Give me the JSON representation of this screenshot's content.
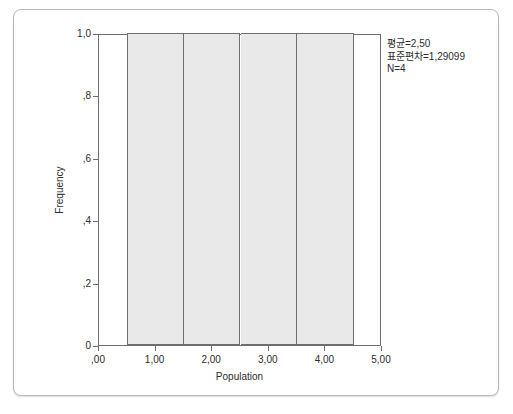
{
  "chart_data": {
    "type": "bar",
    "title": "",
    "xlabel": "Population",
    "ylabel": "Frequency",
    "categories": [
      "1,00",
      "2,00",
      "3,00",
      "4,00"
    ],
    "values": [
      1,
      1,
      1,
      1
    ],
    "bins": [
      {
        "center": 1,
        "left": 0.5,
        "right": 1.5,
        "frequency": 1
      },
      {
        "center": 2,
        "left": 1.5,
        "right": 2.5,
        "frequency": 1
      },
      {
        "center": 3,
        "left": 2.5,
        "right": 3.5,
        "frequency": 1
      },
      {
        "center": 4,
        "left": 3.5,
        "right": 4.5,
        "frequency": 1
      }
    ],
    "xlim": [
      0,
      5
    ],
    "ylim": [
      0,
      1
    ],
    "grid": false,
    "legend": false,
    "x_ticks": [
      {
        "value": 0,
        "label": ",00"
      },
      {
        "value": 1,
        "label": "1,00"
      },
      {
        "value": 2,
        "label": "2,00"
      },
      {
        "value": 3,
        "label": "3,00"
      },
      {
        "value": 4,
        "label": "4,00"
      },
      {
        "value": 5,
        "label": "5,00"
      }
    ],
    "y_ticks": [
      {
        "value": 1.0,
        "label": "1,0"
      },
      {
        "value": 0.8,
        "label": ",8"
      },
      {
        "value": 0.6,
        "label": ",6"
      },
      {
        "value": 0.4,
        "label": ",4"
      },
      {
        "value": 0.2,
        "label": ",2"
      },
      {
        "value": 0.0,
        "label": "0"
      }
    ],
    "bar_fill_color": "#e9e9e9",
    "bar_border_color": "#6e6e6e"
  },
  "annotation": {
    "mean_line": "평균=2,50",
    "stddev_line": "표준편차=1,29099",
    "n_line": "N=4"
  }
}
